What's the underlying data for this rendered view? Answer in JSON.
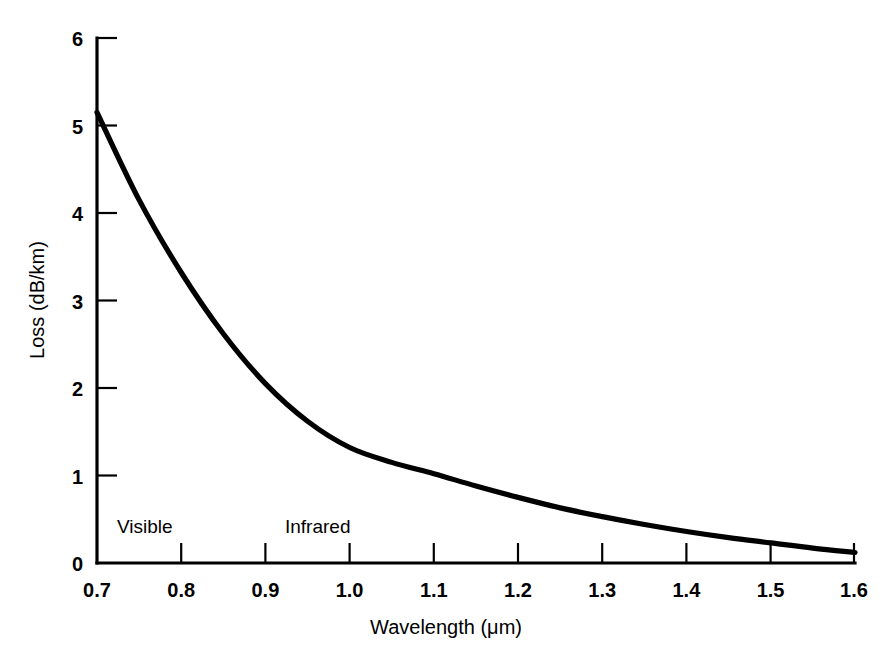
{
  "chart_data": {
    "type": "line",
    "title": "",
    "xlabel": "Wavelength (μm)",
    "ylabel": "Loss (dB/km)",
    "xlim": [
      0.7,
      1.6
    ],
    "ylim": [
      0,
      6
    ],
    "grid": false,
    "legend": "none",
    "line_color": "#000000",
    "axis_color": "#000000",
    "background_color": "#ffffff",
    "xticks": [
      "0.7",
      "0.8",
      "0.9",
      "1.0",
      "1.1",
      "1.2",
      "1.3",
      "1.4",
      "1.5",
      "1.6"
    ],
    "xtick_values": [
      0.7,
      0.8,
      0.9,
      1.0,
      1.1,
      1.2,
      1.3,
      1.4,
      1.5,
      1.6
    ],
    "yticks": [
      "0",
      "1",
      "2",
      "3",
      "4",
      "5",
      "6"
    ],
    "ytick_values": [
      0,
      1,
      2,
      3,
      4,
      5,
      6
    ],
    "series": [
      {
        "name": "Fiber attenuation",
        "x": [
          0.7,
          0.75,
          0.8,
          0.85,
          0.9,
          0.95,
          1.0,
          1.05,
          1.1,
          1.15,
          1.2,
          1.25,
          1.3,
          1.35,
          1.4,
          1.45,
          1.5,
          1.55,
          1.6
        ],
        "y": [
          5.15,
          4.15,
          3.32,
          2.62,
          2.05,
          1.62,
          1.32,
          1.15,
          1.02,
          0.88,
          0.75,
          0.63,
          0.53,
          0.44,
          0.36,
          0.29,
          0.23,
          0.17,
          0.12
        ]
      }
    ],
    "annotations": [
      {
        "text": "Visible",
        "x": 0.735,
        "y": 0.48
      },
      {
        "text": "Infrared",
        "x": 0.925,
        "y": 0.48
      }
    ]
  },
  "axes": {
    "x_title": "Wavelength (μm)",
    "y_title": "Loss (dB/km)"
  },
  "annotations": {
    "visible_label": "Visible",
    "infrared_label": "Infrared"
  },
  "xtick_labels": {
    "t0": "0.7",
    "t1": "0.8",
    "t2": "0.9",
    "t3": "1.0",
    "t4": "1.1",
    "t5": "1.2",
    "t6": "1.3",
    "t7": "1.4",
    "t8": "1.5",
    "t9": "1.6"
  },
  "ytick_labels": {
    "t0": "0",
    "t1": "1",
    "t2": "2",
    "t3": "3",
    "t4": "4",
    "t5": "5",
    "t6": "6"
  }
}
